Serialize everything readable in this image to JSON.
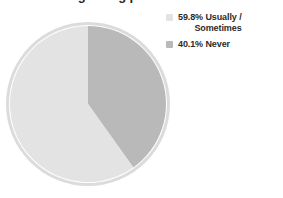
{
  "chart_data": {
    "type": "pie",
    "title": "Pre-existing eating problems",
    "categories": [
      "Usually / Sometimes",
      "Never"
    ],
    "values": [
      59.8,
      40.1
    ],
    "unit": "%",
    "labels": [
      "59.8% Usually / Sometimes",
      "40.1% Never"
    ],
    "colors": [
      "#e3e3e3",
      "#b9b9b9"
    ],
    "legend_position": "right",
    "grid": false,
    "start_angle_deg": 0,
    "direction": "clockwise"
  },
  "title": {
    "text": "Pre-existing eating problems"
  },
  "legend": {
    "items": [
      {
        "swatch_color": "#e3e3e3",
        "line1": "59.8% Usually /",
        "line2": "Sometimes",
        "full_label": "59.8% Usually / Sometimes",
        "percent": "59.8%",
        "name": "Usually / Sometimes"
      },
      {
        "swatch_color": "#b9b9b9",
        "line1": "40.1% Never",
        "line2": "",
        "full_label": "40.1% Never",
        "percent": "40.1%",
        "name": "Never"
      }
    ]
  },
  "pie": {
    "slices": [
      {
        "label": "Never",
        "percent": 40.1,
        "color": "#b9b9b9"
      },
      {
        "label": "Usually / Sometimes",
        "percent": 59.8,
        "color": "#e3e3e3"
      }
    ],
    "rim_color": "#dcdcdc",
    "inner_ring_color": "#ffffff",
    "background": "#ffffff"
  }
}
